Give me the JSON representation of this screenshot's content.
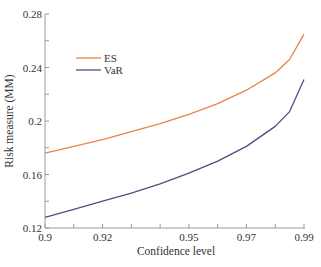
{
  "chart_data": {
    "type": "line",
    "title": "",
    "xlabel": "Confidence level",
    "ylabel": "Risk measure (MM)",
    "x_ticks": [
      "0.9",
      "0.92",
      "0.95",
      "0.97",
      "0.99"
    ],
    "x_tick_positions": [
      0,
      2,
      5,
      7,
      9
    ],
    "y_ticks": [
      "0.12",
      "0.16",
      "0.2",
      "0.24",
      "0.28"
    ],
    "ylim": [
      0.12,
      0.28
    ],
    "x_index_range": [
      0,
      9
    ],
    "grid": false,
    "legend_position": "upper-left",
    "x": [
      0,
      1,
      2,
      3,
      4,
      5,
      6,
      7,
      8,
      8.5,
      9
    ],
    "series": [
      {
        "name": "ES",
        "color": "#E8834A",
        "values": [
          0.176,
          0.181,
          0.186,
          0.192,
          0.198,
          0.205,
          0.213,
          0.223,
          0.236,
          0.246,
          0.265
        ]
      },
      {
        "name": "VaR",
        "color": "#4A5080",
        "values": [
          0.128,
          0.134,
          0.14,
          0.146,
          0.153,
          0.161,
          0.17,
          0.181,
          0.196,
          0.207,
          0.231
        ]
      }
    ]
  },
  "legend": {
    "items": [
      {
        "label": "ES",
        "color": "#E8834A"
      },
      {
        "label": "VaR",
        "color": "#4A5080"
      }
    ]
  }
}
